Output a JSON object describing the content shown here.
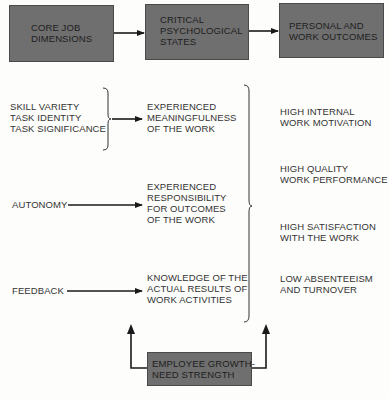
{
  "header_boxes": {
    "core_job_dimensions": "CORE JOB\nDIMENSIONS",
    "critical_psychological_states": "CRITICAL\nPSYCHOLOGICAL\nSTATES",
    "personal_work_outcomes": "PERSONAL AND\nWORK OUTCOMES"
  },
  "core_dimensions": {
    "group1": "SKILL VARIETY\nTASK IDENTITY\nTASK SIGNIFICANCE",
    "autonomy": "AUTONOMY",
    "feedback": "FEEDBACK"
  },
  "psychological_states": {
    "meaningfulness": "EXPERIENCED\nMEANINGFULNESS\nOF THE WORK",
    "responsibility": "EXPERIENCED\nRESPONSIBILITY\nFOR OUTCOMES\nOF THE WORK",
    "knowledge": "KNOWLEDGE OF THE\nACTUAL RESULTS OF\nWORK ACTIVITIES"
  },
  "outcomes": [
    "HIGH INTERNAL\nWORK MOTIVATION",
    "HIGH QUALITY\nWORK PERFORMANCE",
    "HIGH SATISFACTION\nWITH THE WORK",
    "LOW ABSENTEEISM\nAND TURNOVER"
  ],
  "moderator": {
    "label": "EMPLOYEE GROWTH-\nNEED STRENGTH"
  },
  "colors": {
    "box_fill": "#6f6f6f",
    "line": "#1a1a1a",
    "background": "#fdfdfb"
  }
}
